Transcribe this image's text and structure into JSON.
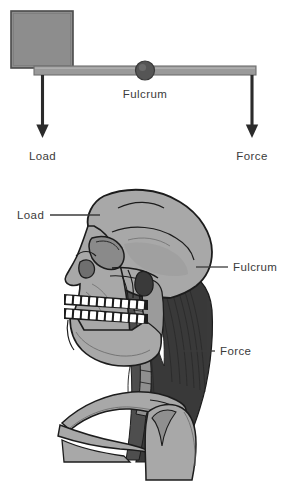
{
  "figure": {
    "title": "",
    "background_color": "#ffffff",
    "panels": [
      {
        "name": "lever-diagram",
        "type": "first-class-lever-schematic",
        "labels": {
          "load": "Load",
          "fulcrum": "Fulcrum",
          "force": "Force"
        }
      },
      {
        "name": "skull-neck-anatomy",
        "type": "lateral-skull-and-neck-illustration",
        "labels": {
          "load": "Load",
          "fulcrum": "Fulcrum",
          "force": "Force"
        }
      }
    ]
  },
  "colors": {
    "background": "#ffffff",
    "text": "#3b3b3b",
    "beam_fill": "#9a9a9a",
    "beam_edge": "#6f6f6f",
    "block_fill": "#8d8d8d",
    "block_edge": "#4a4a4a",
    "fulcrum_fill": "#555555",
    "arrow": "#2b2b2b",
    "bone_fill": "#a8a8a8",
    "bone_shadow": "#8f8f8f",
    "bone_outline": "#1c1c1c",
    "muscle_dark": "#3a3a3a",
    "muscle_mid": "#4e4e4e",
    "tooth_fill": "#ffffff",
    "leader_line": "#3b3b3b"
  },
  "lever": {
    "block_label": "load-block",
    "beam_label": "lever-beam",
    "fulcrum_label": "fulcrum-pivot",
    "load_arrow_label": "load-force-arrow",
    "force_arrow_label": "effort-force-arrow"
  },
  "anatomy": {
    "cranium": "cranium",
    "mandible": "mandible",
    "teeth_upper": "upper-teeth-row",
    "teeth_lower": "lower-teeth-row",
    "orbit": "eye-socket",
    "nasal": "nasal-aperture",
    "neck_muscles": "posterior-neck-muscles",
    "cervical_spine": "cervical-vertebrae",
    "clavicle": "clavicle",
    "scapula": "scapula",
    "ribs": "ribs"
  }
}
